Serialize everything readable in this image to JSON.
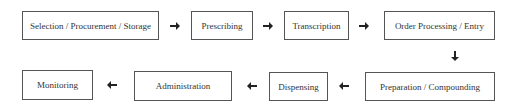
{
  "diagram": {
    "title": "",
    "steps": [
      {
        "id": "selection",
        "label": "Selection / Procurement / Storage"
      },
      {
        "id": "prescribing",
        "label": "Prescribing"
      },
      {
        "id": "transcription",
        "label": "Transcription"
      },
      {
        "id": "order-processing",
        "label": "Order Processing / Entry"
      },
      {
        "id": "preparation",
        "label": "Preparation / Compounding"
      },
      {
        "id": "dispensing",
        "label": "Dispensing"
      },
      {
        "id": "administration",
        "label": "Administration"
      },
      {
        "id": "monitoring",
        "label": "Monitoring"
      }
    ],
    "arrows": [
      {
        "from": "selection",
        "to": "prescribing",
        "direction": "right"
      },
      {
        "from": "prescribing",
        "to": "transcription",
        "direction": "right"
      },
      {
        "from": "transcription",
        "to": "order-processing",
        "direction": "right"
      },
      {
        "from": "order-processing",
        "to": "preparation",
        "direction": "down"
      },
      {
        "from": "preparation",
        "to": "dispensing",
        "direction": "left"
      },
      {
        "from": "dispensing",
        "to": "administration",
        "direction": "left"
      },
      {
        "from": "administration",
        "to": "monitoring",
        "direction": "left"
      }
    ],
    "colors": {
      "border": "#555555",
      "arrow": "#222222",
      "background": "#ffffff"
    }
  }
}
